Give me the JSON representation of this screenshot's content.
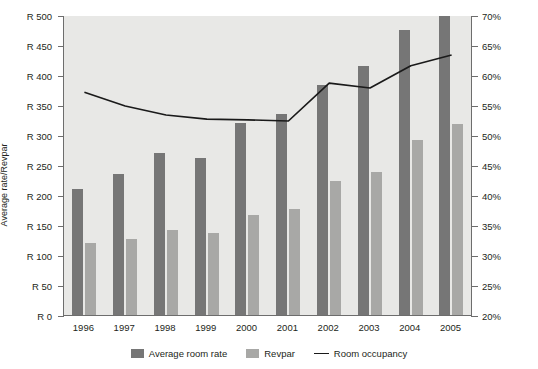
{
  "axes": {
    "y_left_title": "Average rate/Revpar",
    "y_right_title": "Room occupancy",
    "y_left_ticks": [
      "R 500",
      "R 450",
      "R 400",
      "R 350",
      "R 300",
      "R 250",
      "R 200",
      "R 150",
      "R 100",
      "R 50",
      "R 0"
    ],
    "y_right_ticks": [
      "70%",
      "65%",
      "60%",
      "55%",
      "50%",
      "45%",
      "40%",
      "35%",
      "30%",
      "25%",
      "20%"
    ]
  },
  "legend": {
    "items": [
      {
        "label": "Average room rate",
        "type": "bar",
        "color": "#767676"
      },
      {
        "label": "Revpar",
        "type": "bar",
        "color": "#a8a8a6"
      },
      {
        "label": "Room occupancy",
        "type": "line",
        "color": "#1a1a1a"
      }
    ]
  },
  "chart_data": {
    "type": "bar",
    "title": "",
    "xlabel": "",
    "ylabel": "Average rate/Revpar",
    "y2label": "Room occupancy",
    "grid": false,
    "legend_position": "bottom",
    "categories": [
      "1996",
      "1997",
      "1998",
      "1999",
      "2000",
      "2001",
      "2002",
      "2003",
      "2004",
      "2005"
    ],
    "ylim": [
      0,
      500
    ],
    "ytick_step": 50,
    "y2lim": [
      20,
      70
    ],
    "y2tick_step": 5,
    "series": [
      {
        "name": "Average room rate",
        "type": "bar",
        "axis": "left",
        "color": "#767676",
        "values": [
          210,
          235,
          270,
          262,
          320,
          335,
          383,
          415,
          475,
          498
        ]
      },
      {
        "name": "Revpar",
        "type": "bar",
        "axis": "left",
        "color": "#a8a8a6",
        "values": [
          120,
          127,
          141,
          136,
          167,
          176,
          224,
          239,
          291,
          318
        ]
      },
      {
        "name": "Room occupancy",
        "type": "line",
        "axis": "right",
        "color": "#1a1a1a",
        "unit": "%",
        "values": [
          57.3,
          55.0,
          53.5,
          52.8,
          52.7,
          52.5,
          58.8,
          58.0,
          61.7,
          63.5
        ]
      }
    ]
  }
}
